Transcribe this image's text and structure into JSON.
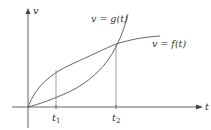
{
  "diagram": {
    "type": "function-graph",
    "axes": {
      "x_label": "t",
      "y_label": "v"
    },
    "curves": [
      {
        "id": "f",
        "label": "v = f(t)",
        "shape": "concave-increasing"
      },
      {
        "id": "g",
        "label": "v = g(t)",
        "shape": "convex-increasing"
      }
    ],
    "ticks": [
      {
        "id": "t1",
        "base": "t",
        "sub": "1"
      },
      {
        "id": "t2",
        "base": "t",
        "sub": "2"
      }
    ],
    "colors": {
      "lines": "#555555",
      "text": "#333333",
      "background": "#ffffff"
    }
  }
}
